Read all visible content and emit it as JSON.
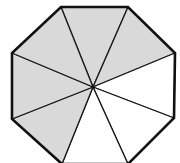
{
  "diagram": {
    "type": "divided-octagon",
    "shape": "regular octagon",
    "total_parts": 8,
    "shaded_parts": 5,
    "unshaded_parts": 3,
    "fraction_shaded": "5/8",
    "colors": {
      "shaded": "#d9d9d9",
      "unshaded": "#ffffff",
      "stroke": "#1a1a1a",
      "outline": "#111111"
    },
    "center": [
      93,
      87
    ],
    "vertices": [
      [
        61,
        7
      ],
      [
        128,
        7
      ],
      [
        175,
        53
      ],
      [
        174,
        118
      ],
      [
        128,
        164
      ],
      [
        62,
        164
      ],
      [
        12,
        119
      ],
      [
        12,
        53
      ]
    ],
    "sectors": [
      {
        "name": "sector-top",
        "shaded": true
      },
      {
        "name": "sector-top-right",
        "shaded": true
      },
      {
        "name": "sector-right",
        "shaded": false
      },
      {
        "name": "sector-bottom-right",
        "shaded": false
      },
      {
        "name": "sector-bottom",
        "shaded": false
      },
      {
        "name": "sector-bottom-left",
        "shaded": true
      },
      {
        "name": "sector-left",
        "shaded": true
      },
      {
        "name": "sector-top-left",
        "shaded": true
      }
    ]
  }
}
